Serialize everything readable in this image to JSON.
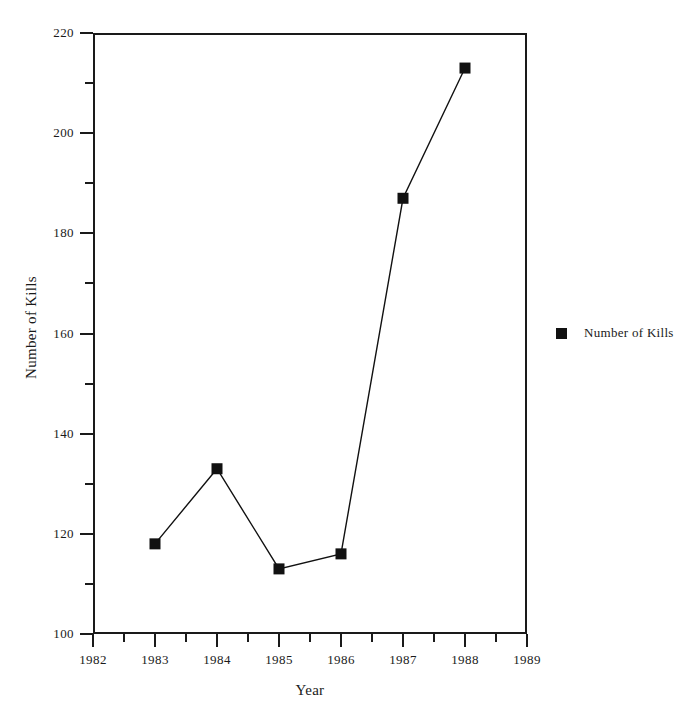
{
  "chart_data": {
    "type": "line",
    "title": "",
    "xlabel": "Year",
    "ylabel": "Number of Kills",
    "xlim": [
      1982,
      1989
    ],
    "ylim": [
      100,
      220
    ],
    "grid": false,
    "legend_position": "right",
    "series": [
      {
        "name": "Number of Kills",
        "color": "#111111",
        "marker": "square",
        "x": [
          1983,
          1984,
          1985,
          1986,
          1987,
          1988
        ],
        "values": [
          118,
          133,
          113,
          116,
          187,
          213
        ]
      }
    ],
    "x_ticks": [
      1982,
      1983,
      1984,
      1985,
      1986,
      1987,
      1988,
      1989
    ],
    "x_tick_labels": [
      "1982",
      "1983",
      "1984",
      "1985",
      "1986",
      "1987",
      "1988",
      "1989"
    ],
    "x_minor_ticks": [
      1982.5,
      1983.5,
      1984.5,
      1985.5,
      1986.5,
      1987.5,
      1988.5
    ],
    "y_ticks": [
      100,
      120,
      140,
      160,
      180,
      200,
      220
    ],
    "y_tick_labels": [
      "100",
      "120",
      "140",
      "160",
      "180",
      "200",
      "220"
    ],
    "y_minor_ticks": [
      110,
      130,
      150,
      170,
      190,
      210
    ]
  },
  "legend": {
    "entries": [
      {
        "label": "Number of Kills",
        "color": "#111111"
      }
    ]
  },
  "axes": {
    "x_title": "Year",
    "y_title": "Number of Kills"
  }
}
